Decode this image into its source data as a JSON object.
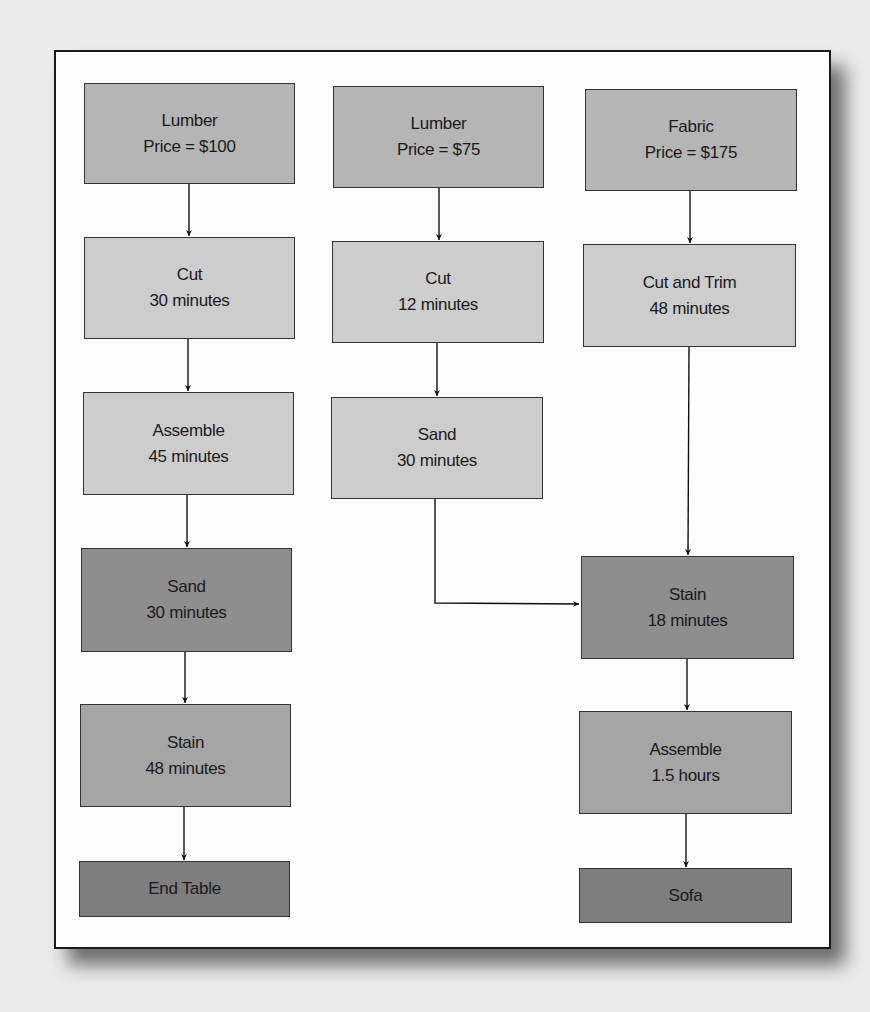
{
  "colors": {
    "background": "#ececec",
    "frame": "#fdfdfd",
    "material": "#b5b5b5",
    "process_light": "#cdcdcd",
    "process_dark": "#8e8e8e",
    "process_medium": "#a5a5a5",
    "product": "#7e7e7e"
  },
  "columns": [
    {
      "name": "end-table",
      "nodes": [
        {
          "line1": "Lumber",
          "line2": "Price = $100"
        },
        {
          "line1": "Cut",
          "line2": "30 minutes"
        },
        {
          "line1": "Assemble",
          "line2": "45 minutes"
        },
        {
          "line1": "Sand",
          "line2": "30 minutes"
        },
        {
          "line1": "Stain",
          "line2": "48 minutes"
        },
        {
          "line1": "End Table"
        }
      ]
    },
    {
      "name": "lumber-75",
      "nodes": [
        {
          "line1": "Lumber",
          "line2": "Price = $75"
        },
        {
          "line1": "Cut",
          "line2": "12 minutes"
        },
        {
          "line1": "Sand",
          "line2": "30 minutes"
        }
      ]
    },
    {
      "name": "sofa",
      "nodes": [
        {
          "line1": "Fabric",
          "line2": "Price = $175"
        },
        {
          "line1": "Cut and Trim",
          "line2": "48 minutes"
        },
        {
          "line1": "Stain",
          "line2": "18 minutes"
        },
        {
          "line1": "Assemble",
          "line2": "1.5 hours"
        },
        {
          "line1": "Sofa"
        }
      ]
    }
  ]
}
